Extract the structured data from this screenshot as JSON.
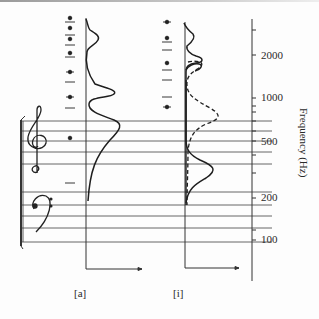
{
  "figure": {
    "panels": [
      {
        "id": "a",
        "label": "[a]"
      },
      {
        "id": "i",
        "label": "[i]"
      }
    ],
    "axis": {
      "title": "Frequency (Hz)",
      "ticks": [
        {
          "value": 2000,
          "label": "2000"
        },
        {
          "value": 1000,
          "label": "1000"
        },
        {
          "value": 500,
          "label": "500"
        },
        {
          "value": 200,
          "label": "200"
        },
        {
          "value": 100,
          "label": "100"
        }
      ]
    },
    "staff": {
      "treble_clef": "treble-clef",
      "bass_clef": "bass-clef"
    },
    "legend": {
      "solid": "solid curve",
      "dashed": "dashed curve"
    },
    "colors": {
      "ink": "#1e1e1e",
      "staff": "#444444",
      "background": "#fdfdfd"
    }
  }
}
